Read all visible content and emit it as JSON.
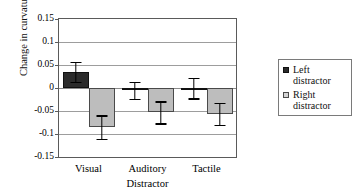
{
  "chart_data": {
    "type": "bar",
    "title": "",
    "xlabel": "Distractor",
    "ylabel": "Change in curvature",
    "categories": [
      "Visual",
      "Auditory",
      "Tactile"
    ],
    "ylim": [
      -0.15,
      0.15
    ],
    "yticks": [
      "0.15",
      "0.1",
      "0.05",
      "0",
      "-0.05",
      "-0.1",
      "-0.15"
    ],
    "ytick_values": [
      0.15,
      0.1,
      0.05,
      0,
      -0.05,
      -0.1,
      -0.15
    ],
    "grid": true,
    "legend_position": "right",
    "series": [
      {
        "name": "Left distractor",
        "color": "#2b2b2b",
        "values": [
          0.035,
          -0.005,
          0.0
        ],
        "errors": [
          0.022,
          0.019,
          0.022
        ]
      },
      {
        "name": "Right distractor",
        "color": "#bdbdbd",
        "values": [
          -0.085,
          -0.053,
          -0.056
        ],
        "errors": [
          0.026,
          0.024,
          0.024
        ]
      }
    ]
  },
  "legend": {
    "items": [
      {
        "label_line1": "Left",
        "label_line2": "distractor",
        "swatch": "left"
      },
      {
        "label_line1": "Right",
        "label_line2": "distractor",
        "swatch": "right"
      }
    ]
  }
}
